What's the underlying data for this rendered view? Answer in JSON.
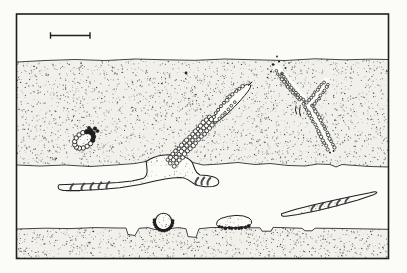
{
  "figure": {
    "has_text": false,
    "scale_bar_label": ""
  },
  "drawing": {
    "palette": {
      "paper": "#fbfbf8",
      "ink": "#1f1f1f",
      "stipple": "#2e2e2e",
      "band_fill": "#f1f0eb",
      "shade": "#3a3a3a"
    },
    "frame": {
      "x": 16.5,
      "y": 14,
      "w": 372,
      "h": 244.5,
      "stroke_w": 1.6
    },
    "scale_bar": {
      "x1": 50.5,
      "x2": 90,
      "y": 35.5,
      "tick_top": 32.3,
      "tick_bottom": 38.7,
      "stroke_w": 1.4
    },
    "bands": {
      "middle": {
        "top": [
          [
            17,
            62
          ],
          [
            45,
            60.5
          ],
          [
            75,
            59.5
          ],
          [
            105,
            60.5
          ],
          [
            135,
            59
          ],
          [
            165,
            59.8
          ],
          [
            195,
            60.3
          ],
          [
            225,
            59
          ],
          [
            255,
            59.8
          ],
          [
            285,
            60.5
          ],
          [
            315,
            58.8
          ],
          [
            345,
            59.8
          ],
          [
            370,
            59.2
          ],
          [
            388,
            59.5
          ]
        ],
        "bottom": [
          [
            17,
            165
          ],
          [
            40,
            166
          ],
          [
            65,
            165
          ],
          [
            90,
            166.5
          ],
          [
            115,
            165
          ],
          [
            135,
            163.5
          ],
          [
            146,
            161.5
          ],
          [
            158,
            156.8
          ],
          [
            171,
            155.3
          ],
          [
            183,
            158
          ],
          [
            193,
            162.5
          ],
          [
            203,
            165
          ],
          [
            220,
            164
          ],
          [
            238,
            162.5
          ],
          [
            255,
            164.5
          ],
          [
            270,
            163.5
          ],
          [
            288,
            165.5
          ],
          [
            305,
            166
          ],
          [
            318,
            164
          ],
          [
            330,
            164.5
          ],
          [
            336,
            167
          ],
          [
            342,
            164.5
          ],
          [
            355,
            165.5
          ],
          [
            370,
            166.5
          ],
          [
            388,
            167
          ]
        ],
        "dots": 3000,
        "bounds": [
          17,
          57,
          371,
          112
        ]
      },
      "bottom": {
        "top": [
          [
            17,
            229
          ],
          [
            45,
            228.2
          ],
          [
            70,
            228.6
          ],
          [
            95,
            227.6
          ],
          [
            118,
            228
          ],
          [
            126,
            228
          ],
          [
            128,
            234.5
          ],
          [
            135,
            235.5
          ],
          [
            139,
            228.3
          ],
          [
            148,
            227.6
          ],
          [
            154,
            229.3
          ],
          [
            163,
            230.3
          ],
          [
            171,
            228.4
          ],
          [
            179,
            227.6
          ],
          [
            186,
            228.8
          ],
          [
            188,
            236.6
          ],
          [
            196,
            237.4
          ],
          [
            199,
            228.8
          ],
          [
            210,
            227.6
          ],
          [
            228,
            227.4
          ],
          [
            245,
            227.8
          ],
          [
            260,
            227.8
          ],
          [
            262,
            231.2
          ],
          [
            271,
            231.2
          ],
          [
            273,
            227.4
          ],
          [
            288,
            227.8
          ],
          [
            302,
            228.3
          ],
          [
            305,
            230.8
          ],
          [
            312,
            230.8
          ],
          [
            315,
            228.2
          ],
          [
            335,
            228.4
          ],
          [
            360,
            228.8
          ],
          [
            388,
            229.3
          ]
        ],
        "bottom_y": 258.5,
        "dots": 950,
        "bounds": [
          17,
          227,
          371,
          31
        ]
      }
    },
    "structures": {
      "hypha": {
        "d": "M59,184.8 L80,184 L100,183.6 L118,182.6 L132,181 L143,178.6 C146,177 147.5,173 147,169 L146.2,161.5 Q153,156.5 162,155.2 Q174,154 183,156.6 Q190,158.6 192.5,163 L195,169.5 Q196.5,173.5 200,175 L207,175.6 L213,176.8 Q218.5,178.2 218.8,182 Q218.5,185.5 213,186.4 L205,186.8 L198,185.4 Q193.5,184 190.5,181.4 Q186,177.6 180,177.4 Q172,177.8 165,179 L155,181 L140,184.5 L120,187.8 L100,189.6 L80,190.6 L66,190.6 Q60.5,190.4 58.5,188.6 Q57.5,186 59,184.8 Z"
      },
      "spindle": {
        "d": "M281.5,213.8 L295,209.6 L315,204.6 L335,200 L355,195.7 L370,192.7 Q375.5,191.3 376.6,192.1 Q377.5,193 373.5,194.8 L358,200 L338,205.6 L318,210.4 L298,214.4 L286,216.2 Q281,216.9 281.5,213.8 Z"
      },
      "loop": {
        "d": "M213.5,118.5 C219,106 230,94 243,86.2 Q248.5,83.2 250.2,84.8 Q251.8,86.4 247.5,92 C240,101.5 229.5,112.5 220.5,119.5 Q215.5,123 213.8,121.6 Q212.6,120.4 213.5,118.5 Z"
      },
      "loop_hook": "M248.5,85.5 L252,82",
      "blob": {
        "d": "M216.5,224.5 Q216,220.5 221,218.4 Q228,215.8 236,215.4 Q244,215.2 249,218 Q252.5,220.2 251.5,223.4 Q250.5,226 244,226.8 L233,227.6 L223,227.4 Q217.5,227 216.5,224.5 Z"
      },
      "circle": {
        "cx": 163.5,
        "cy": 221.5,
        "r": 8.2
      },
      "oval": {
        "cx": 84,
        "cy": 140,
        "rx": 10.5,
        "ry": 7,
        "rot": -35,
        "beads": 15,
        "bead_r": 2.2
      },
      "oval_clump": [
        [
          91,
          130.5,
          2.0
        ],
        [
          95,
          128.5,
          1.8
        ],
        [
          93.5,
          133,
          1.8
        ],
        [
          97.5,
          131,
          1.6
        ],
        [
          89,
          128,
          1.7
        ]
      ],
      "y_underlay": [
        {
          "pts": [
            [
              331,
              149
            ],
            [
              307,
              104
            ],
            [
              277,
              69
            ]
          ],
          "w": 8
        },
        {
          "pts": [
            [
              308,
              106
            ],
            [
              326,
              81
            ]
          ],
          "w": 7
        }
      ],
      "chains": [
        {
          "pts": [
            [
              167.5,
              160
            ],
            [
              210.5,
              115.5
            ]
          ],
          "sp": 4.0,
          "r": 2.0,
          "fill": "open"
        },
        {
          "pts": [
            [
              170.5,
              163
            ],
            [
              213.5,
              118
            ]
          ],
          "sp": 4.0,
          "r": 2.1,
          "fill": "open"
        },
        {
          "pts": [
            [
              174,
              165.8
            ],
            [
              216.5,
              121
            ]
          ],
          "sp": 4.0,
          "r": 2.0,
          "fill": "open"
        },
        {
          "pts": [
            [
              213.5,
              117
            ],
            [
              222,
              105
            ],
            [
              231,
              95.5
            ],
            [
              240,
              88
            ],
            [
              246.5,
              84.5
            ]
          ],
          "sp": 4.3,
          "r": 1.7,
          "fill": "open"
        },
        {
          "pts": [
            [
              219,
              119
            ],
            [
              227,
              110.5
            ],
            [
              235,
              102
            ]
          ],
          "sp": 4.5,
          "r": 1.5,
          "fill": "open"
        },
        {
          "pts": [
            [
              327.5,
              149
            ],
            [
              317,
              129
            ],
            [
              307.5,
              111
            ],
            [
              303,
              103.5
            ]
          ],
          "sp": 3.4,
          "r": 1.5,
          "fill": "open"
        },
        {
          "pts": [
            [
              334.5,
              147.5
            ],
            [
              325,
              128
            ],
            [
              315.5,
              110.5
            ],
            [
              310.5,
              104.5
            ]
          ],
          "sp": 3.4,
          "r": 1.5,
          "fill": "open"
        },
        {
          "pts": [
            [
              300,
              99.5
            ],
            [
              290,
              89.5
            ],
            [
              281,
              78.5
            ],
            [
              275.5,
              69
            ]
          ],
          "sp": 3.4,
          "r": 1.4,
          "fill": "open"
        },
        {
          "pts": [
            [
              305.5,
              102.5
            ],
            [
              296.5,
              93
            ],
            [
              288,
              83
            ],
            [
              280.5,
              72
            ]
          ],
          "sp": 3.4,
          "r": 1.4,
          "fill": "open"
        },
        {
          "pts": [
            [
              306.5,
              103
            ],
            [
              313.5,
              94.5
            ],
            [
              320.5,
              86.5
            ],
            [
              325.5,
              79.5
            ]
          ],
          "sp": 3.4,
          "r": 1.4,
          "fill": "open"
        },
        {
          "pts": [
            [
              312.5,
              106.5
            ],
            [
              318.5,
              98.5
            ],
            [
              324.5,
              90.5
            ],
            [
              329,
              82.5
            ]
          ],
          "sp": 3.4,
          "r": 1.4,
          "fill": "open"
        },
        {
          "pts": [
            [
              219,
              226.8
            ],
            [
              226,
              227.9
            ],
            [
              234,
              228.3
            ],
            [
              242,
              227.9
            ],
            [
              249,
              226.3
            ]
          ],
          "sp": 3.3,
          "r": 1.35,
          "fill": "dark"
        }
      ],
      "circle_beads": {
        "cx": 163.5,
        "cy": 221.5,
        "rad": 9.2,
        "from": -5,
        "to": 190,
        "step": 15,
        "r": 1.5
      },
      "septa_hypha": [
        {
          "x": 72,
          "y": 187.2,
          "h": 6.2
        },
        {
          "x": 83,
          "y": 186.8,
          "h": 6.4
        },
        {
          "x": 92,
          "y": 186.3,
          "h": 6.6
        },
        {
          "x": 100,
          "y": 185.7,
          "h": 6.6
        },
        {
          "x": 108,
          "y": 185.1,
          "h": 6.4
        },
        {
          "x": 197,
          "y": 181.3,
          "h": 7
        },
        {
          "x": 203,
          "y": 181,
          "h": 7
        },
        {
          "x": 209,
          "y": 181.3,
          "h": 6.6
        }
      ],
      "septa_spindle": [
        {
          "x": 313,
          "y": 208.3,
          "h": 6
        },
        {
          "x": 321.5,
          "y": 206.2,
          "h": 6
        },
        {
          "x": 330,
          "y": 204.5,
          "h": 6.2
        },
        {
          "x": 338.5,
          "y": 202.7,
          "h": 5.8
        },
        {
          "x": 347,
          "y": 200.4,
          "h": 5.6
        }
      ],
      "crotch_marks": [
        "M296,106 Q294.5,110 296.5,114",
        "M300,107 Q298.5,112 300.5,116"
      ],
      "scatter_dots": [
        [
          273,
          64.5,
          1.2
        ],
        [
          279,
          61.5,
          1.1
        ],
        [
          285.5,
          68,
          1.0
        ],
        [
          271,
          71.5,
          1.0
        ],
        [
          282,
          74,
          0.9
        ],
        [
          277,
          56.5,
          0.9
        ],
        [
          289,
          63,
          0.8
        ],
        [
          267.5,
          77.5,
          0.8
        ],
        [
          330,
          152.5,
          1.0
        ],
        [
          333.5,
          151,
          0.9
        ]
      ],
      "free_dots": [
        [
          186,
          73,
          1.4
        ]
      ],
      "patches": [
        {
          "clip": "hypha",
          "rect": [
            146,
            155,
            50,
            22
          ],
          "n": 48
        },
        {
          "clip": "hypha",
          "rect": [
            118,
            177,
            34,
            9
          ],
          "n": 16
        },
        {
          "clip": "spindle",
          "rect": [
            292,
            197,
            62,
            16
          ],
          "n": 52
        },
        {
          "clip": "circle",
          "rect": [
            156,
            214,
            16,
            16
          ],
          "n": 26
        },
        {
          "clip": "blob",
          "rect": [
            218,
            216.5,
            33,
            11
          ],
          "n": 20
        },
        {
          "clip": "oval",
          "rect": [
            75,
            132,
            19,
            15
          ],
          "n": 22
        }
      ]
    }
  }
}
